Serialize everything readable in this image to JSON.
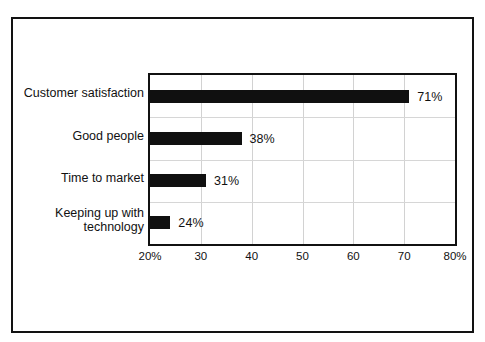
{
  "chart_data": {
    "type": "bar",
    "orientation": "horizontal",
    "title": "",
    "subtitle": "",
    "xlabel": "",
    "ylabel": "",
    "categories": [
      "Customer satisfaction",
      "Good people",
      "Time to market",
      "Keeping up with\ntechnology"
    ],
    "values": [
      71,
      38,
      31,
      24
    ],
    "value_labels": [
      "71%",
      "38%",
      "31%",
      "24%"
    ],
    "xlim": [
      20,
      80
    ],
    "xticks": [
      20,
      30,
      40,
      50,
      60,
      70,
      80
    ],
    "xtick_labels": [
      "20%",
      "30",
      "40",
      "50",
      "60",
      "70",
      "80%"
    ],
    "grid": "both",
    "legend": "none",
    "bar_color": "#101010",
    "plot_border_color": "#111111",
    "gridline_color": "#d2d2d2",
    "background_color": "#ffffff"
  },
  "figure": {
    "frame_color": "#121212"
  }
}
